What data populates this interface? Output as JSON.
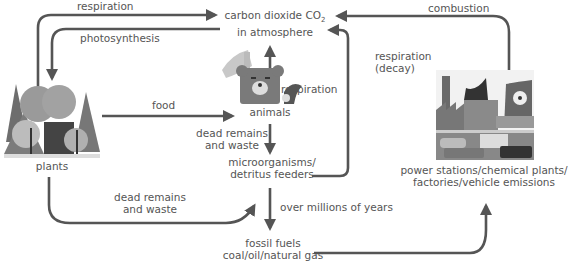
{
  "diagram": {
    "colors": {
      "arrow": "#555555",
      "text": "#555555"
    },
    "nodes": {
      "atmosphere": {
        "line1": "carbon dioxide CO",
        "sub": "2",
        "line2": "in atmosphere"
      },
      "plants": {
        "label": "plants",
        "icon": "trees-icon"
      },
      "animals": {
        "label": "animals",
        "icon": "animals-icon"
      },
      "microorganisms": {
        "line1": "microorganisms/",
        "line2": "detritus feeders"
      },
      "fossil_fuels": {
        "line1": "fossil fuels",
        "line2": "coal/oil/natural gas"
      },
      "industry": {
        "line1": "power stations/chemical plants/",
        "line2": "factories/vehicle emissions",
        "icon": "factory-icon"
      }
    },
    "edges": [
      {
        "from": "plants",
        "to": "atmosphere",
        "label": "respiration"
      },
      {
        "from": "atmosphere",
        "to": "plants",
        "label": "photosynthesis"
      },
      {
        "from": "plants",
        "to": "animals",
        "label": "food"
      },
      {
        "from": "animals",
        "to": "atmosphere",
        "label": "respiration"
      },
      {
        "from": "animals",
        "to": "microorganisms",
        "label_line1": "dead remains",
        "label_line2": "and waste"
      },
      {
        "from": "plants",
        "to": "microorganisms",
        "label_line1": "dead remains",
        "label_line2": "and waste"
      },
      {
        "from": "microorganisms",
        "to": "atmosphere",
        "label_line1": "respiration",
        "label_line2": "(decay)"
      },
      {
        "from": "microorganisms",
        "to": "fossil_fuels",
        "label": "over millions of years"
      },
      {
        "from": "fossil_fuels",
        "to": "industry",
        "label": ""
      },
      {
        "from": "industry",
        "to": "atmosphere",
        "label": "combustion"
      }
    ]
  }
}
